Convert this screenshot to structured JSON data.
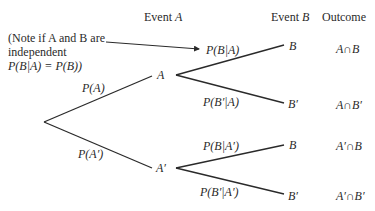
{
  "headers": {
    "event_a_prefix": "Event ",
    "event_a_var": "A",
    "event_b_prefix": "Event ",
    "event_b_var": "B",
    "outcome": "Outcome"
  },
  "note": {
    "line1": "(Note if A and B are",
    "line2": "independent",
    "line3": "P(B|A) = P(B))"
  },
  "nodes": {
    "a": "A",
    "a_prime": "A′",
    "b_top": "B",
    "b_prime_top": "B′",
    "b_bottom": "B",
    "b_prime_bottom": "B′"
  },
  "branches": {
    "p_a": "P(A)",
    "p_a_prime": "P(A′)",
    "p_b_given_a": "P(B|A)",
    "p_b_prime_given_a": "P(B′|A)",
    "p_b_given_a_prime": "P(B|A′)",
    "p_b_prime_given_a_prime": "P(B′|A′)"
  },
  "outcomes": [
    "A∩B",
    "A∩B′",
    "A′∩B",
    "A′∩B′"
  ],
  "colors": {
    "line": "#2a2a2a",
    "text": "#2a2a2a",
    "background": "#ffffff"
  }
}
